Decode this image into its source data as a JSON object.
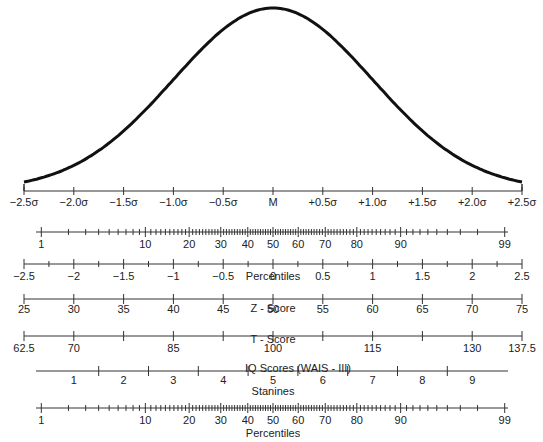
{
  "chart_data": {
    "type": "line",
    "curve": {
      "name": "normal curve",
      "mean_label": "M"
    },
    "sigma_axis": {
      "ticks": [
        "−2.5σ",
        "−2.0σ",
        "−1.5σ",
        "−1.0σ",
        "−0.5σ",
        "M",
        "+0.5σ",
        "+1.0σ",
        "+1.5σ",
        "+2.0σ",
        "+2.5σ"
      ],
      "values": [
        -2.5,
        -2.0,
        -1.5,
        -1.0,
        -0.5,
        0,
        0.5,
        1.0,
        1.5,
        2.0,
        2.5
      ]
    },
    "scales": [
      {
        "name": "Percentiles",
        "labels": [
          "1",
          "10",
          "20",
          "30",
          "40",
          "50",
          "60",
          "70",
          "80",
          "90",
          "99"
        ]
      },
      {
        "name": "Z - Score",
        "labels": [
          "−2.5",
          "−2",
          "−1.5",
          "−1",
          "−0.5",
          "0",
          "0.5",
          "1",
          "1.5",
          "2",
          "2.5"
        ]
      },
      {
        "name": "T - Score",
        "labels": [
          "25",
          "30",
          "35",
          "40",
          "45",
          "50",
          "55",
          "60",
          "65",
          "70",
          "75"
        ]
      },
      {
        "name": "IQ Scores (WAIS - III)",
        "labels": [
          "62.5",
          "70",
          "85",
          "100",
          "115",
          "130",
          "137.5"
        ]
      },
      {
        "name": "Stanines",
        "labels": [
          "1",
          "2",
          "3",
          "4",
          "5",
          "6",
          "7",
          "8",
          "9"
        ]
      },
      {
        "name": "Percentiles",
        "labels": [
          "1",
          "10",
          "20",
          "30",
          "40",
          "50",
          "60",
          "70",
          "80",
          "90",
          "99"
        ]
      }
    ]
  },
  "titles": {
    "percentiles_top": "Percentiles",
    "zscore": "Z - Score",
    "tscore": "T - Score",
    "iq": "IQ Scores (WAIS - III)",
    "stanines": "Stanines",
    "percentiles_bottom": "Percentiles"
  }
}
